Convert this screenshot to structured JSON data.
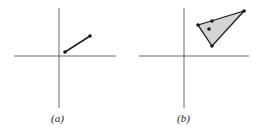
{
  "panels": [
    {
      "caption": "(a)",
      "description": "Line segment in first quadrant"
    },
    {
      "caption": "(b)",
      "description": "Shaded triangle in first quadrant with point on edge and interior point"
    }
  ],
  "colors": {
    "stroke": "#1a1a1a",
    "fill": "#d4d4d4"
  }
}
